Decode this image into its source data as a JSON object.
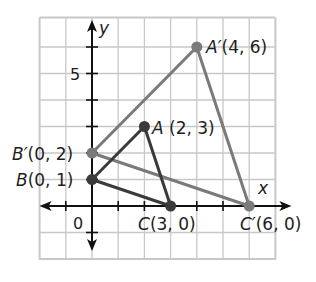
{
  "figure": {
    "axes": {
      "x_label": "x",
      "y_label": "y",
      "origin_label": "0",
      "y_tick_label": "5",
      "x_range": [
        -2,
        7
      ],
      "y_range": [
        -2,
        7
      ],
      "grid": true
    },
    "colors": {
      "grid": "#c8c8c8",
      "axis": "#111111",
      "original": "#3a3a3a",
      "image": "#7a7a7a"
    },
    "triangles": {
      "original": {
        "name": "ABC",
        "points": [
          {
            "id": "A",
            "label_name": "A",
            "label_coords": " (2, 3)",
            "x": 2,
            "y": 3
          },
          {
            "id": "B",
            "label_name": "B",
            "label_coords": "(0, 1)",
            "x": 0,
            "y": 1
          },
          {
            "id": "C",
            "label_name": "C",
            "label_coords": "(3, 0)",
            "x": 3,
            "y": 0
          }
        ]
      },
      "image": {
        "name": "A'B'C'",
        "points": [
          {
            "id": "A'",
            "label_name": "A′",
            "label_coords": "(4, 6)",
            "x": 4,
            "y": 6
          },
          {
            "id": "B'",
            "label_name": "B′",
            "label_coords": "(0, 2)",
            "x": 0,
            "y": 2
          },
          {
            "id": "C'",
            "label_name": "C′",
            "label_coords": "(6, 0)",
            "x": 6,
            "y": 0
          }
        ]
      }
    }
  }
}
